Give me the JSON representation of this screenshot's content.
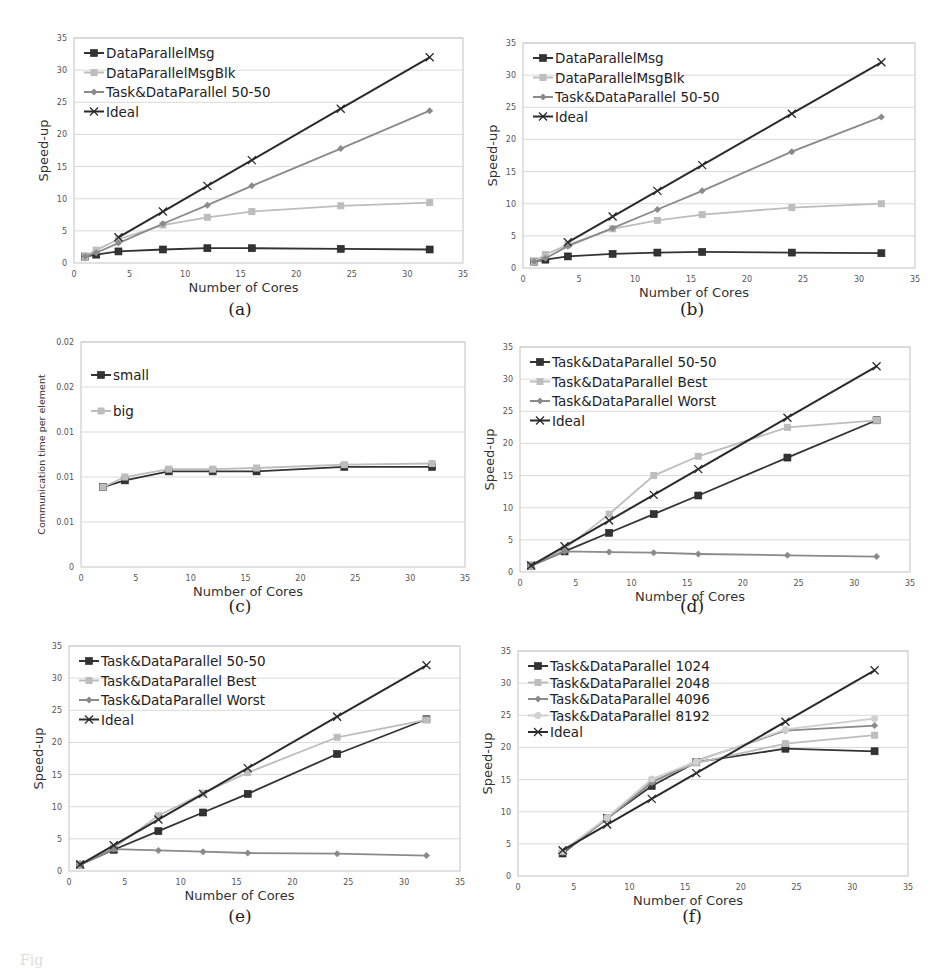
{
  "figure": {
    "panels": [
      {
        "id": "a",
        "caption": "(a)"
      },
      {
        "id": "b",
        "caption": "(b)"
      },
      {
        "id": "c",
        "caption": "(c)"
      },
      {
        "id": "d",
        "caption": "(d)"
      },
      {
        "id": "e",
        "caption": "(e)"
      },
      {
        "id": "f",
        "caption": "(f)"
      }
    ],
    "bleed_text": "Fig"
  },
  "colors": {
    "dark": "#333333",
    "light": "#bdbdbd",
    "mid": "#8a8a8a",
    "pale": "#d0d0d0",
    "black": "#2a2a2a",
    "grid": "#cfcfcf",
    "frame": "#b5b5b5"
  },
  "chart_data": [
    {
      "panel": "a",
      "type": "line",
      "title": "",
      "xlabel": "Number of Cores",
      "ylabel": "Speed-up",
      "xlim": [
        0,
        35
      ],
      "ylim": [
        0,
        35
      ],
      "xticks": [
        "0",
        "5",
        "10",
        "15",
        "20",
        "25",
        "30",
        "35"
      ],
      "yticks": [
        "0",
        "5",
        "10",
        "15",
        "20",
        "25",
        "30",
        "35"
      ],
      "grid": true,
      "legend_position": "upper-left",
      "series": [
        {
          "name": "DataParallelMsg",
          "marker": "square",
          "color": "dark",
          "x": [
            1,
            2,
            4,
            8,
            12,
            16,
            24,
            32
          ],
          "y": [
            1.0,
            1.3,
            1.8,
            2.1,
            2.3,
            2.3,
            2.2,
            2.1
          ]
        },
        {
          "name": "DataParallelMsgBlk",
          "marker": "square",
          "color": "light",
          "x": [
            1,
            2,
            4,
            8,
            12,
            16,
            24,
            32
          ],
          "y": [
            1.0,
            2.0,
            3.7,
            5.9,
            7.1,
            8.0,
            8.9,
            9.4
          ]
        },
        {
          "name": "Task&DataParallel 50-50",
          "marker": "diamond",
          "color": "mid",
          "x": [
            1,
            2,
            4,
            8,
            12,
            16,
            24,
            32
          ],
          "y": [
            1.0,
            1.6,
            3.1,
            6.1,
            9.0,
            12.0,
            17.8,
            23.7
          ]
        },
        {
          "name": "Ideal",
          "marker": "x",
          "color": "black",
          "x": [
            4,
            8,
            12,
            16,
            24,
            32
          ],
          "y": [
            4,
            8,
            12,
            16,
            24,
            32
          ]
        }
      ]
    },
    {
      "panel": "b",
      "type": "line",
      "title": "",
      "xlabel": "Number of Cores",
      "ylabel": "Speed-up",
      "xlim": [
        0,
        35
      ],
      "ylim": [
        0,
        35
      ],
      "xticks": [
        "0",
        "5",
        "10",
        "15",
        "20",
        "25",
        "30",
        "35"
      ],
      "yticks": [
        "0",
        "5",
        "10",
        "15",
        "20",
        "25",
        "30",
        "35"
      ],
      "grid": true,
      "legend_position": "upper-left",
      "series": [
        {
          "name": "DataParallelMsg",
          "marker": "square",
          "color": "dark",
          "x": [
            1,
            2,
            4,
            8,
            12,
            16,
            24,
            32
          ],
          "y": [
            1.0,
            1.3,
            1.8,
            2.2,
            2.4,
            2.5,
            2.4,
            2.3
          ]
        },
        {
          "name": "DataParallelMsgBlk",
          "marker": "square",
          "color": "light",
          "x": [
            1,
            2,
            4,
            8,
            12,
            16,
            24,
            32
          ],
          "y": [
            1.0,
            2.1,
            3.6,
            6.1,
            7.4,
            8.3,
            9.4,
            10.0
          ]
        },
        {
          "name": "Task&DataParallel 50-50",
          "marker": "diamond",
          "color": "mid",
          "x": [
            1,
            2,
            4,
            8,
            12,
            16,
            24,
            32
          ],
          "y": [
            1.0,
            1.5,
            3.4,
            6.2,
            9.1,
            12.0,
            18.1,
            23.5
          ]
        },
        {
          "name": "Ideal",
          "marker": "x",
          "color": "black",
          "x": [
            4,
            8,
            12,
            16,
            24,
            32
          ],
          "y": [
            4,
            8,
            12,
            16,
            24,
            32
          ]
        }
      ]
    },
    {
      "panel": "c",
      "type": "line",
      "title": "",
      "xlabel": "Number of Cores",
      "ylabel": "Communication time per element",
      "xlim": [
        0,
        35
      ],
      "ylim": [
        0,
        0.02
      ],
      "xticks": [
        "0",
        "5",
        "10",
        "15",
        "20",
        "25",
        "30",
        "35"
      ],
      "yticks": [
        "0",
        "0.01",
        "0.01",
        "0.01",
        "0.02",
        "0.02"
      ],
      "ytick_values": [
        0,
        0.004,
        0.008,
        0.012,
        0.016,
        0.02
      ],
      "grid": true,
      "legend_position": "upper-left",
      "series": [
        {
          "name": "small",
          "marker": "square",
          "color": "dark",
          "x": [
            2,
            4,
            8,
            12,
            16,
            24,
            32
          ],
          "y": [
            0.0071,
            0.0077,
            0.0085,
            0.0085,
            0.0085,
            0.0089,
            0.0089
          ]
        },
        {
          "name": "big",
          "marker": "square",
          "color": "light",
          "x": [
            2,
            4,
            8,
            12,
            16,
            24,
            32
          ],
          "y": [
            0.0071,
            0.008,
            0.0087,
            0.0087,
            0.0088,
            0.0091,
            0.0092
          ]
        }
      ]
    },
    {
      "panel": "d",
      "type": "line",
      "title": "",
      "xlabel": "Number of Cores",
      "ylabel": "Speed-up",
      "xlim": [
        0,
        35
      ],
      "ylim": [
        0,
        35
      ],
      "xticks": [
        "0",
        "5",
        "10",
        "15",
        "20",
        "25",
        "30",
        "35"
      ],
      "yticks": [
        "0",
        "5",
        "10",
        "15",
        "20",
        "25",
        "30",
        "35"
      ],
      "grid": true,
      "legend_position": "upper-left",
      "series": [
        {
          "name": "Task&DataParallel 50-50",
          "marker": "square",
          "color": "dark",
          "x": [
            1,
            4,
            8,
            12,
            16,
            24,
            32
          ],
          "y": [
            1.0,
            3.2,
            6.1,
            9.0,
            11.9,
            17.8,
            23.6
          ]
        },
        {
          "name": "Task&DataParallel Best",
          "marker": "square",
          "color": "light",
          "x": [
            1,
            4,
            8,
            12,
            16,
            24,
            32
          ],
          "y": [
            1.0,
            3.6,
            9.0,
            15.0,
            18.0,
            22.5,
            23.6
          ]
        },
        {
          "name": "Task&DataParallel Worst",
          "marker": "diamond",
          "color": "mid",
          "x": [
            1,
            4,
            8,
            12,
            16,
            24,
            32
          ],
          "y": [
            1.0,
            3.2,
            3.1,
            3.0,
            2.8,
            2.6,
            2.4
          ]
        },
        {
          "name": "Ideal",
          "marker": "x",
          "color": "black",
          "x": [
            1,
            4,
            8,
            12,
            16,
            24,
            32
          ],
          "y": [
            1,
            4,
            8,
            12,
            16,
            24,
            32
          ]
        }
      ]
    },
    {
      "panel": "e",
      "type": "line",
      "title": "",
      "xlabel": "Number of Cores",
      "ylabel": "Speed-up",
      "xlim": [
        0,
        35
      ],
      "ylim": [
        0,
        35
      ],
      "xticks": [
        "0",
        "5",
        "10",
        "15",
        "20",
        "25",
        "30",
        "35"
      ],
      "yticks": [
        "0",
        "5",
        "10",
        "15",
        "20",
        "25",
        "30",
        "35"
      ],
      "grid": true,
      "legend_position": "upper-left",
      "series": [
        {
          "name": "Task&DataParallel 50-50",
          "marker": "square",
          "color": "dark",
          "x": [
            1,
            4,
            8,
            12,
            16,
            24,
            32
          ],
          "y": [
            1.0,
            3.3,
            6.2,
            9.1,
            12.0,
            18.2,
            23.6
          ]
        },
        {
          "name": "Task&DataParallel Best",
          "marker": "square",
          "color": "light",
          "x": [
            1,
            4,
            8,
            12,
            16,
            24,
            32
          ],
          "y": [
            1.0,
            3.6,
            8.6,
            12.1,
            15.3,
            20.8,
            23.5
          ]
        },
        {
          "name": "Task&DataParallel Worst",
          "marker": "diamond",
          "color": "mid",
          "x": [
            1,
            4,
            8,
            12,
            16,
            24,
            32
          ],
          "y": [
            1.0,
            3.4,
            3.2,
            3.0,
            2.8,
            2.7,
            2.4
          ]
        },
        {
          "name": "Ideal",
          "marker": "x",
          "color": "black",
          "x": [
            1,
            4,
            8,
            12,
            16,
            24,
            32
          ],
          "y": [
            1,
            4,
            8,
            12,
            16,
            24,
            32
          ]
        }
      ]
    },
    {
      "panel": "f",
      "type": "line",
      "title": "",
      "xlabel": "Number of Cores",
      "ylabel": "Speed-up",
      "xlim": [
        0,
        35
      ],
      "ylim": [
        0,
        35
      ],
      "xticks": [
        "0",
        "5",
        "10",
        "15",
        "20",
        "25",
        "30",
        "35"
      ],
      "yticks": [
        "0",
        "5",
        "10",
        "15",
        "20",
        "25",
        "30",
        "35"
      ],
      "grid": true,
      "legend_position": "upper-left",
      "series": [
        {
          "name": "Task&DataParallel 1024",
          "marker": "square",
          "color": "dark",
          "x": [
            4,
            8,
            12,
            16,
            24,
            32
          ],
          "y": [
            3.5,
            9.0,
            14.0,
            17.7,
            19.8,
            19.4
          ]
        },
        {
          "name": "Task&DataParallel 2048",
          "marker": "square",
          "color": "light",
          "x": [
            4,
            8,
            12,
            16,
            24,
            32
          ],
          "y": [
            3.8,
            8.9,
            14.8,
            17.6,
            20.6,
            21.9
          ]
        },
        {
          "name": "Task&DataParallel 4096",
          "marker": "diamond",
          "color": "mid",
          "x": [
            4,
            8,
            12,
            16,
            24,
            32
          ],
          "y": [
            3.7,
            8.9,
            14.5,
            17.9,
            22.6,
            23.4
          ]
        },
        {
          "name": "Task&DataParallel 8192",
          "marker": "circle",
          "color": "pale",
          "x": [
            4,
            8,
            12,
            16,
            24,
            32
          ],
          "y": [
            3.9,
            9.1,
            15.1,
            17.8,
            22.8,
            24.5
          ]
        },
        {
          "name": "Ideal",
          "marker": "x",
          "color": "black",
          "x": [
            4,
            8,
            12,
            16,
            24,
            32
          ],
          "y": [
            4,
            8,
            12,
            16,
            24,
            32
          ]
        }
      ]
    }
  ],
  "layout": {
    "a": {
      "x0": 74,
      "x1": 463,
      "y0": 263,
      "y1": 38,
      "cap_x": 240,
      "cap_y": 311
    },
    "b": {
      "x0": 523,
      "x1": 915,
      "y0": 268,
      "y1": 43,
      "cap_x": 692,
      "cap_y": 311
    },
    "c": {
      "x0": 81,
      "x1": 465,
      "y0": 567,
      "y1": 342,
      "cap_x": 240,
      "cap_y": 608
    },
    "d": {
      "x0": 520,
      "x1": 910,
      "y0": 572,
      "y1": 347,
      "cap_x": 692,
      "cap_y": 608
    },
    "e": {
      "x0": 69,
      "x1": 460,
      "y0": 871,
      "y1": 646,
      "cap_x": 240,
      "cap_y": 918
    },
    "f": {
      "x0": 518,
      "x1": 908,
      "y0": 876,
      "y1": 651,
      "cap_x": 692,
      "cap_y": 918
    }
  }
}
